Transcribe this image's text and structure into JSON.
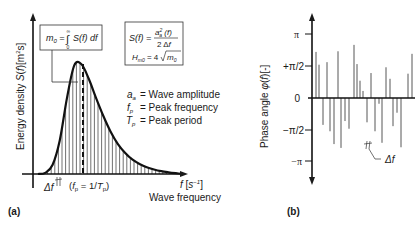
{
  "panel_a": {
    "label": "(a)",
    "y_axis_label": "Energy density S(f)[m²s]",
    "x_axis_label_unit": "f [s⁻¹]",
    "x_axis_label": "Wave frequency",
    "m0_formula": "m₀ = ∫₀^∞ S(f) df",
    "spectrum_formula_line1": "S(f) =",
    "spectrum_formula_num": "a²ₐ (f)",
    "spectrum_formula_den": "2 Δf",
    "hm0_formula": "Hₘ₀ = 4√m₀",
    "legend": [
      {
        "symbol": "aₐ",
        "text": "= Wave amplitude"
      },
      {
        "symbol": "fₚ",
        "text": "= Peak frequency"
      },
      {
        "symbol": "Tₚ",
        "text": "= Peak period"
      }
    ],
    "delta_f_label": "Δf",
    "peak_label": "(fₚ = 1/Tₚ)"
  },
  "panel_b": {
    "label": "(b)",
    "y_axis_label": "Phase angle φ(f)[-]",
    "ticks": [
      "π",
      "+π/2",
      "0",
      "−π/2",
      "−π"
    ],
    "delta_f_label": "Δf"
  },
  "chart_data": [
    {
      "type": "area",
      "title": "Wave energy density spectrum",
      "xlabel": "Wave frequency f [s⁻¹]",
      "ylabel": "Energy density S(f) [m²s]",
      "description": "Single-peaked spectrum, hatched with vertical lines at spacing Δf; dashed vertical line at peak frequency f_p = 1/T_p",
      "x": [
        0,
        0.05,
        0.1,
        0.15,
        0.2,
        0.25,
        0.3,
        0.35,
        0.4,
        0.45,
        0.5,
        0.55,
        0.6,
        0.65,
        0.7,
        0.75,
        0.8,
        0.85,
        0.9,
        0.95,
        1.0
      ],
      "values": [
        0,
        0.01,
        0.08,
        0.3,
        0.68,
        0.97,
        0.98,
        0.85,
        0.68,
        0.52,
        0.38,
        0.27,
        0.19,
        0.13,
        0.09,
        0.06,
        0.04,
        0.025,
        0.015,
        0.007,
        0
      ],
      "peak_x": 0.28,
      "grid": false
    },
    {
      "type": "bar",
      "title": "Random phase angles",
      "ylabel": "Phase angle φ(f) [-]",
      "ylim": [
        -3.1416,
        3.1416
      ],
      "ytick_labels": [
        "−π",
        "−π/2",
        "0",
        "+π/2",
        "π"
      ],
      "values_in_pi": [
        0.72,
        0.52,
        -0.42,
        0.56,
        -0.52,
        -0.72,
        0.73,
        -0.78,
        -0.36,
        -0.48,
        0.83,
        0.53,
        0.27,
        0.11,
        -0.38,
        0.39,
        -0.52,
        -0.09,
        -0.7,
        0.48,
        0.3,
        -0.44,
        -0.23,
        -0.77,
        0.38,
        0.69
      ],
      "grid": false
    }
  ]
}
